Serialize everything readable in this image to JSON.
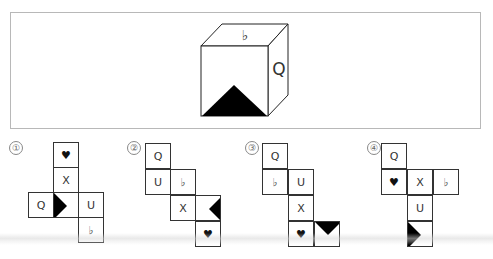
{
  "question": {
    "cube": {
      "top_face": "♭",
      "right_face": "Q",
      "front_face": "black-triangle-bottom"
    }
  },
  "options": [
    {
      "label": "①",
      "cells": [
        {
          "x": 53,
          "y": 142,
          "content": "heart",
          "text": "♥"
        },
        {
          "x": 53,
          "y": 167,
          "content": "text",
          "text": "X"
        },
        {
          "x": 28,
          "y": 192,
          "content": "text",
          "text": "Q"
        },
        {
          "x": 53,
          "y": 192,
          "content": "triangle-right",
          "text": ""
        },
        {
          "x": 78,
          "y": 192,
          "content": "text",
          "text": "U"
        },
        {
          "x": 78,
          "y": 217,
          "content": "flat",
          "text": "♭"
        }
      ]
    },
    {
      "label": "②",
      "cells": [
        {
          "x": 145,
          "y": 143,
          "content": "text",
          "text": "Q"
        },
        {
          "x": 145,
          "y": 169,
          "content": "text",
          "text": "U"
        },
        {
          "x": 170,
          "y": 169,
          "content": "flat",
          "text": "♭"
        },
        {
          "x": 170,
          "y": 195,
          "content": "text",
          "text": "X"
        },
        {
          "x": 195,
          "y": 195,
          "content": "triangle-left",
          "text": ""
        },
        {
          "x": 195,
          "y": 221,
          "content": "heart",
          "text": "♥"
        }
      ]
    },
    {
      "label": "③",
      "cells": [
        {
          "x": 262,
          "y": 143,
          "content": "text",
          "text": "Q"
        },
        {
          "x": 262,
          "y": 169,
          "content": "flat",
          "text": "♭"
        },
        {
          "x": 288,
          "y": 169,
          "content": "text",
          "text": "U"
        },
        {
          "x": 288,
          "y": 195,
          "content": "text",
          "text": "X"
        },
        {
          "x": 288,
          "y": 221,
          "content": "heart",
          "text": "♥"
        },
        {
          "x": 314,
          "y": 221,
          "content": "triangle-down",
          "text": ""
        }
      ]
    },
    {
      "label": "④",
      "cells": [
        {
          "x": 381,
          "y": 143,
          "content": "text",
          "text": "Q"
        },
        {
          "x": 381,
          "y": 169,
          "content": "heart",
          "text": "♥"
        },
        {
          "x": 407,
          "y": 169,
          "content": "text",
          "text": "X"
        },
        {
          "x": 433,
          "y": 169,
          "content": "flat",
          "text": "♭"
        },
        {
          "x": 407,
          "y": 195,
          "content": "text",
          "text": "U"
        },
        {
          "x": 407,
          "y": 221,
          "content": "triangle-right",
          "text": ""
        }
      ]
    }
  ],
  "option_label_positions": [
    {
      "x": 9,
      "y": 141
    },
    {
      "x": 127,
      "y": 141
    },
    {
      "x": 245,
      "y": 141
    },
    {
      "x": 367,
      "y": 141
    }
  ]
}
